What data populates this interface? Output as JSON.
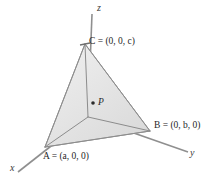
{
  "figure": {
    "kind": "3d-tetrahedron-coordinate-diagram",
    "background_color": "#ffffff",
    "line_color": "#8c8c8c",
    "text_color": "#262626"
  },
  "axes": {
    "z_label": "z",
    "y_label": "y",
    "x_label": "x"
  },
  "vertices": {
    "C": {
      "name": "C",
      "equals": "=",
      "coords": "(0, 0, c)",
      "full": "C = (0, 0, c)"
    },
    "B": {
      "name": "B",
      "equals": "=",
      "coords": "(0, b, 0)",
      "full": "B = (0, b, 0)"
    },
    "A": {
      "name": "A",
      "equals": "=",
      "coords": "(a, 0, 0)",
      "full": "A = (a, 0, 0)"
    }
  },
  "point": {
    "label": "P",
    "marker": "dot"
  },
  "faces": {
    "left_fill_start": "#f2f2f2",
    "left_fill_end": "#e2e2e2",
    "right_fill_start": "#ededed",
    "right_fill_end": "#dcdcdc",
    "bottom_fill_start": "#e6e6e6",
    "bottom_fill_end": "#d6d6d6"
  }
}
